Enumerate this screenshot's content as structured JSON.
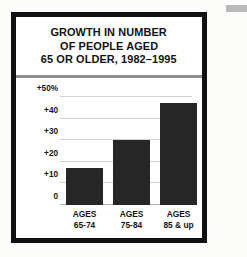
{
  "figure": {
    "title_lines": [
      "GROWTH IN NUMBER",
      "OF PEOPLE AGED",
      "65 OR OLDER, 1982–1995"
    ]
  },
  "colors": {
    "bar": "#262626",
    "frame": "#111111",
    "gridline": "#d2d2d2",
    "divider": "#8e8e8e",
    "background": "#ffffff"
  },
  "chart_data": {
    "type": "bar",
    "title": "GROWTH IN NUMBER OF PEOPLE AGED 65 OR OLDER, 1982–1995",
    "categories": [
      "AGES 65-74",
      "AGES 75-84",
      "AGES 85 & up"
    ],
    "category_lines": [
      {
        "line1": "AGES",
        "line2": "65-74"
      },
      {
        "line1": "AGES",
        "line2": "75-84"
      },
      {
        "line1": "AGES",
        "line2": "85 & up"
      }
    ],
    "values": [
      17,
      30,
      47
    ],
    "xlabel": "",
    "ylabel": "",
    "ylim": [
      0,
      50
    ],
    "yticks": [
      0,
      10,
      20,
      30,
      40,
      50
    ],
    "ytick_labels": [
      "0",
      "+10",
      "+20",
      "+30",
      "+40",
      "+50%"
    ],
    "grid": true,
    "legend": "none"
  }
}
